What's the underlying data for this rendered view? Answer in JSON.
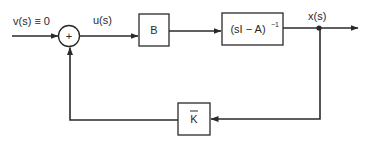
{
  "diagram": {
    "type": "block-diagram",
    "title": "",
    "signals": {
      "input": "v(s) ≡ 0",
      "control": "u(s)",
      "state": "x(s)"
    },
    "summing_junction": {
      "sign": "+"
    },
    "blocks": [
      {
        "id": "B",
        "label": "B"
      },
      {
        "id": "resolvent",
        "label_main": "(sI − A)",
        "label_sup": "−1"
      },
      {
        "id": "K",
        "label": "K",
        "overbar": true
      }
    ],
    "connections": [
      {
        "from": "input",
        "to": "summing_junction",
        "arrow": true
      },
      {
        "from": "summing_junction",
        "to": "B",
        "label": "u(s)",
        "arrow": true
      },
      {
        "from": "B",
        "to": "resolvent",
        "arrow": true
      },
      {
        "from": "resolvent",
        "to": "output",
        "label": "x(s)",
        "arrow": true
      },
      {
        "from": "pickoff",
        "to": "K",
        "arrow": true,
        "path": "down-left"
      },
      {
        "from": "K",
        "to": "summing_junction",
        "arrow": true,
        "path": "left-up"
      }
    ],
    "colors": {
      "line": "#2a2a2a",
      "background": "#ffffff"
    }
  }
}
